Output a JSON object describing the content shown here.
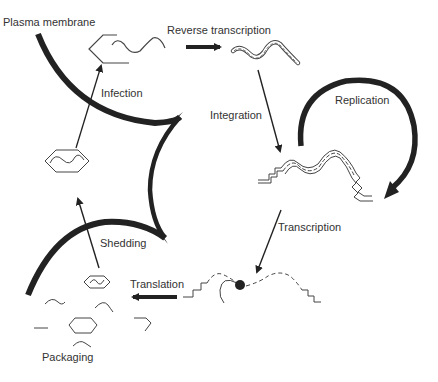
{
  "diagram": {
    "labels": {
      "plasma_membrane": "Plasma membrane",
      "reverse_transcription": "Reverse transcription",
      "infection": "Infection",
      "integration": "Integration",
      "replication": "Replication",
      "transcription": "Transcription",
      "shedding": "Shedding",
      "translation": "Translation",
      "packaging": "Packaging"
    },
    "colors": {
      "ink": "#222222",
      "text": "#333333",
      "background": "#ffffff"
    },
    "stages": [
      {
        "id": "infection",
        "icon": "virion-entering-icon"
      },
      {
        "id": "reverse_transcription",
        "icon": "rna-dna-hybrid-icon"
      },
      {
        "id": "integration",
        "icon": "integrated-provirus-icon"
      },
      {
        "id": "replication",
        "icon": "circular-arrow-icon"
      },
      {
        "id": "transcription",
        "icon": "mrna-ribosome-icon"
      },
      {
        "id": "translation",
        "icon": "thick-arrow-left-icon"
      },
      {
        "id": "packaging",
        "icon": "capsid-components-icon"
      },
      {
        "id": "shedding",
        "icon": "budding-virion-icon"
      }
    ]
  }
}
